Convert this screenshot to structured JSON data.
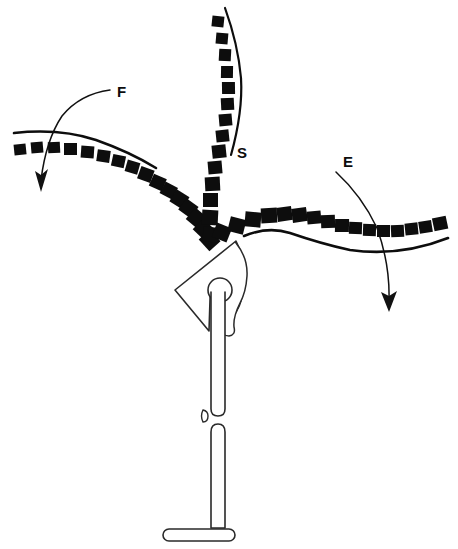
{
  "figure": {
    "background_color": "#ffffff",
    "ink_color": "#0d0d0d",
    "outline_color": "#2a2a2a",
    "width": 458,
    "height": 549
  },
  "labels": [
    {
      "id": "F",
      "text": "F",
      "x": 117,
      "y": 97,
      "meaning": "flexion-branch-label"
    },
    {
      "id": "S",
      "text": "S",
      "x": 237,
      "y": 158,
      "meaning": "superior-branch-label"
    },
    {
      "id": "E",
      "text": "E",
      "x": 343,
      "y": 167,
      "meaning": "extension-branch-label"
    }
  ],
  "branches": [
    {
      "id": "F",
      "name": "left-branch",
      "label": "F",
      "square_count": 22,
      "rail_side": "above",
      "direction": "upper-left"
    },
    {
      "id": "S",
      "name": "top-branch",
      "label": "S",
      "square_count": 17,
      "rail_side": "right",
      "direction": "up"
    },
    {
      "id": "E",
      "name": "right-branch",
      "label": "E",
      "square_count": 20,
      "rail_side": "below",
      "direction": "right"
    }
  ],
  "arrows": [
    {
      "id": "F-arrow",
      "name": "flexion-direction-arrow",
      "from_label": "F",
      "points_to": "down-left",
      "tip_x": 41,
      "tip_y": 190
    },
    {
      "id": "E-arrow",
      "name": "extension-direction-arrow",
      "from_label": "E",
      "points_to": "down",
      "tip_x": 389,
      "tip_y": 310
    }
  ],
  "stand": {
    "name": "mounting-stand",
    "parts": [
      {
        "id": "triangle-plate",
        "label": "triangular-mount-plate"
      },
      {
        "id": "head-knob",
        "label": "round-head-knob"
      },
      {
        "id": "hook",
        "label": "curved-hook"
      },
      {
        "id": "upper-post",
        "label": "upper-post"
      },
      {
        "id": "lower-post",
        "label": "lower-post"
      },
      {
        "id": "base-foot",
        "label": "horizontal-base-foot"
      },
      {
        "id": "gap-tick",
        "label": "post-gap-tick"
      }
    ]
  }
}
